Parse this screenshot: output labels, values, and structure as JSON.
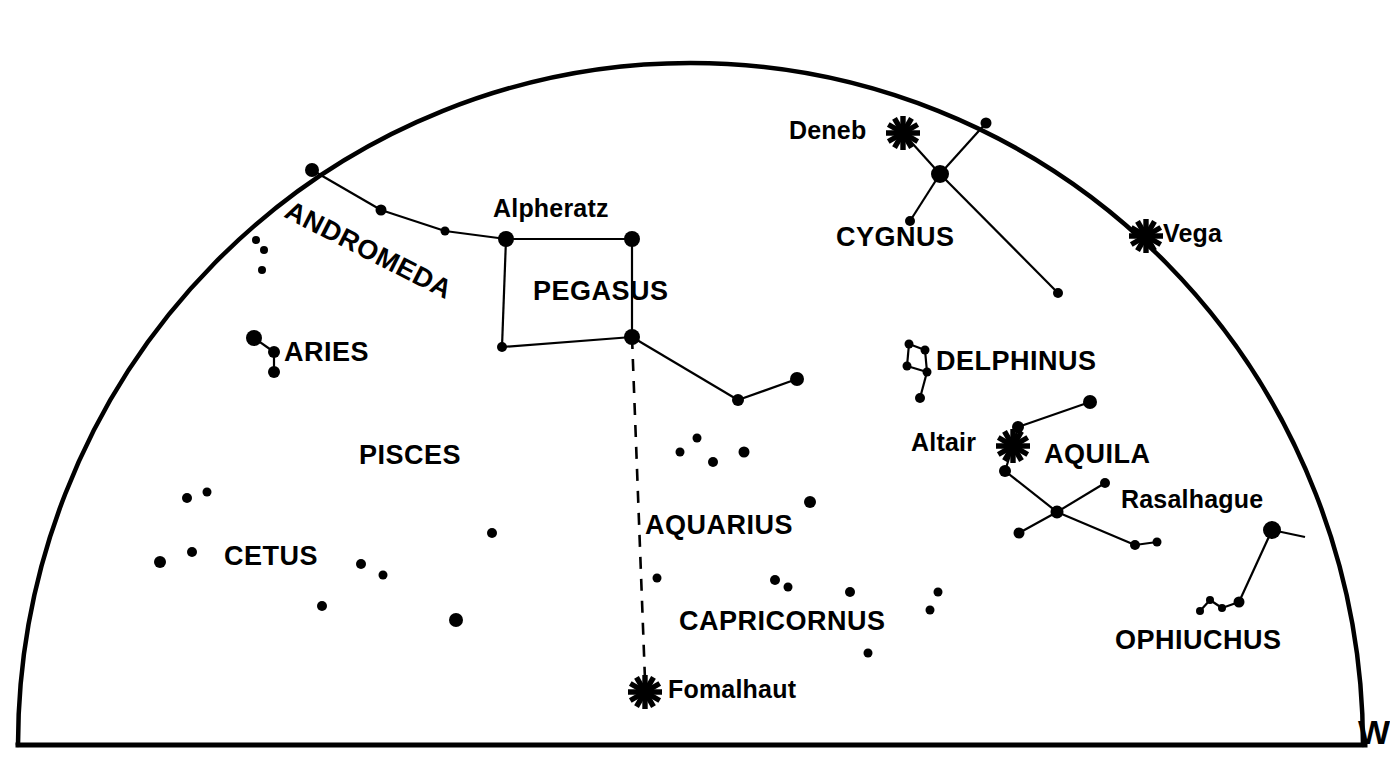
{
  "chart_data": {
    "type": "scatter",
    "xlabel": "",
    "ylabel": "",
    "xlim": [
      0,
      1381
    ],
    "ylim": [
      0,
      773
    ],
    "grid": false,
    "legend": false,
    "dome": {
      "left_x": 18,
      "right_x": 1363,
      "baseline_y": 745,
      "apex_y": 63,
      "apex_x": 690
    },
    "bright_star_markers": [
      {
        "name": "Deneb",
        "x": 903,
        "y": 133,
        "marker": "asterisk"
      },
      {
        "name": "Vega",
        "x": 1146,
        "y": 236,
        "marker": "asterisk"
      },
      {
        "name": "Altair",
        "x": 1013,
        "y": 446,
        "marker": "asterisk"
      },
      {
        "name": "Fomalhaut",
        "x": 645,
        "y": 692,
        "marker": "asterisk"
      }
    ],
    "constellations": [
      {
        "name": "ANDROMEDA",
        "label_x": 293,
        "label_y": 197,
        "rotation": 27
      },
      {
        "name": "PEGASUS",
        "label_x": 533,
        "label_y": 278
      },
      {
        "name": "ARIES",
        "label_x": 284,
        "label_y": 339
      },
      {
        "name": "PISCES",
        "label_x": 359,
        "label_y": 442
      },
      {
        "name": "CETUS",
        "label_x": 224,
        "label_y": 543
      },
      {
        "name": "AQUARIUS",
        "label_x": 645,
        "label_y": 512
      },
      {
        "name": "CAPRICORNUS",
        "label_x": 679,
        "label_y": 608
      },
      {
        "name": "CYGNUS",
        "label_x": 836,
        "label_y": 224
      },
      {
        "name": "DELPHINUS",
        "label_x": 936,
        "label_y": 348
      },
      {
        "name": "AQUILA",
        "label_x": 1044,
        "label_y": 441
      },
      {
        "name": "OPHIUCHUS",
        "label_x": 1115,
        "label_y": 627
      }
    ],
    "named_stars": [
      {
        "name": "Alpheratz",
        "label_x": 493,
        "label_y": 196
      },
      {
        "name": "Deneb",
        "label_x": 789,
        "label_y": 118
      },
      {
        "name": "Vega",
        "label_x": 1163,
        "label_y": 221
      },
      {
        "name": "Altair",
        "label_x": 911,
        "label_y": 430
      },
      {
        "name": "Rasalhague",
        "label_x": 1121,
        "label_y": 487
      },
      {
        "name": "Fomalhaut",
        "label_x": 668,
        "label_y": 677
      }
    ],
    "compass": [
      {
        "label": "W",
        "x": 1358,
        "y": 715
      }
    ],
    "stars": [
      {
        "x": 312,
        "y": 170,
        "r": 7
      },
      {
        "x": 381,
        "y": 210,
        "r": 5.5
      },
      {
        "x": 445,
        "y": 231,
        "r": 4.5
      },
      {
        "x": 506,
        "y": 239,
        "r": 8
      },
      {
        "x": 632,
        "y": 239,
        "r": 8
      },
      {
        "x": 502,
        "y": 347,
        "r": 5
      },
      {
        "x": 632,
        "y": 337,
        "r": 8
      },
      {
        "x": 738,
        "y": 400,
        "r": 6
      },
      {
        "x": 797,
        "y": 379,
        "r": 7
      },
      {
        "x": 254,
        "y": 338,
        "r": 8
      },
      {
        "x": 274,
        "y": 352,
        "r": 6
      },
      {
        "x": 274,
        "y": 372,
        "r": 6
      },
      {
        "x": 256,
        "y": 240,
        "r": 4
      },
      {
        "x": 264,
        "y": 250,
        "r": 4
      },
      {
        "x": 262,
        "y": 270,
        "r": 4
      },
      {
        "x": 187,
        "y": 498,
        "r": 5
      },
      {
        "x": 207,
        "y": 492,
        "r": 4.5
      },
      {
        "x": 160,
        "y": 562,
        "r": 6
      },
      {
        "x": 192,
        "y": 552,
        "r": 5
      },
      {
        "x": 361,
        "y": 564,
        "r": 5
      },
      {
        "x": 383,
        "y": 575,
        "r": 4.5
      },
      {
        "x": 492,
        "y": 533,
        "r": 5
      },
      {
        "x": 322,
        "y": 606,
        "r": 5
      },
      {
        "x": 456,
        "y": 620,
        "r": 7
      },
      {
        "x": 680,
        "y": 452,
        "r": 4.5
      },
      {
        "x": 697,
        "y": 438,
        "r": 4.5
      },
      {
        "x": 713,
        "y": 462,
        "r": 5
      },
      {
        "x": 744,
        "y": 452,
        "r": 5.5
      },
      {
        "x": 810,
        "y": 502,
        "r": 6
      },
      {
        "x": 657,
        "y": 578,
        "r": 4.5
      },
      {
        "x": 775,
        "y": 580,
        "r": 5
      },
      {
        "x": 788,
        "y": 587,
        "r": 4.5
      },
      {
        "x": 850,
        "y": 592,
        "r": 5
      },
      {
        "x": 938,
        "y": 592,
        "r": 4.5
      },
      {
        "x": 930,
        "y": 610,
        "r": 4.5
      },
      {
        "x": 868,
        "y": 653,
        "r": 4.5
      },
      {
        "x": 940,
        "y": 174,
        "r": 9
      },
      {
        "x": 986,
        "y": 123,
        "r": 5.5
      },
      {
        "x": 910,
        "y": 221,
        "r": 5
      },
      {
        "x": 1058,
        "y": 293,
        "r": 5
      },
      {
        "x": 909,
        "y": 344,
        "r": 4.5
      },
      {
        "x": 925,
        "y": 350,
        "r": 4.5
      },
      {
        "x": 927,
        "y": 372,
        "r": 4.5
      },
      {
        "x": 907,
        "y": 366,
        "r": 4.5
      },
      {
        "x": 920,
        "y": 398,
        "r": 5
      },
      {
        "x": 1018,
        "y": 427,
        "r": 6
      },
      {
        "x": 1090,
        "y": 402,
        "r": 7
      },
      {
        "x": 1005,
        "y": 471,
        "r": 6
      },
      {
        "x": 1057,
        "y": 512,
        "r": 6.5
      },
      {
        "x": 1019,
        "y": 533,
        "r": 5.5
      },
      {
        "x": 1105,
        "y": 483,
        "r": 5
      },
      {
        "x": 1135,
        "y": 545,
        "r": 5
      },
      {
        "x": 1157,
        "y": 542,
        "r": 4.5
      },
      {
        "x": 1272,
        "y": 530,
        "r": 9
      },
      {
        "x": 1239,
        "y": 602,
        "r": 5.5
      },
      {
        "x": 1222,
        "y": 608,
        "r": 4
      },
      {
        "x": 1210,
        "y": 600,
        "r": 4
      },
      {
        "x": 1200,
        "y": 611,
        "r": 4
      }
    ],
    "lines": [
      {
        "from": [
          312,
          170
        ],
        "to": [
          381,
          210
        ]
      },
      {
        "from": [
          381,
          210
        ],
        "to": [
          445,
          231
        ]
      },
      {
        "from": [
          445,
          231
        ],
        "to": [
          506,
          239
        ]
      },
      {
        "from": [
          506,
          239
        ],
        "to": [
          632,
          239
        ]
      },
      {
        "from": [
          506,
          239
        ],
        "to": [
          502,
          347
        ]
      },
      {
        "from": [
          502,
          347
        ],
        "to": [
          632,
          337
        ]
      },
      {
        "from": [
          632,
          239
        ],
        "to": [
          632,
          337
        ]
      },
      {
        "from": [
          632,
          337
        ],
        "to": [
          738,
          400
        ]
      },
      {
        "from": [
          738,
          400
        ],
        "to": [
          797,
          379
        ]
      },
      {
        "from": [
          254,
          338
        ],
        "to": [
          274,
          352
        ]
      },
      {
        "from": [
          274,
          352
        ],
        "to": [
          274,
          372
        ]
      },
      {
        "from": [
          903,
          133
        ],
        "to": [
          940,
          174
        ]
      },
      {
        "from": [
          940,
          174
        ],
        "to": [
          986,
          123
        ]
      },
      {
        "from": [
          940,
          174
        ],
        "to": [
          910,
          221
        ]
      },
      {
        "from": [
          940,
          174
        ],
        "to": [
          1058,
          293
        ]
      },
      {
        "from": [
          909,
          344
        ],
        "to": [
          925,
          350
        ]
      },
      {
        "from": [
          925,
          350
        ],
        "to": [
          927,
          372
        ]
      },
      {
        "from": [
          927,
          372
        ],
        "to": [
          907,
          366
        ]
      },
      {
        "from": [
          907,
          366
        ],
        "to": [
          909,
          344
        ]
      },
      {
        "from": [
          927,
          372
        ],
        "to": [
          920,
          398
        ]
      },
      {
        "from": [
          1018,
          427
        ],
        "to": [
          1090,
          402
        ]
      },
      {
        "from": [
          1018,
          427
        ],
        "to": [
          1013,
          446
        ]
      },
      {
        "from": [
          1013,
          446
        ],
        "to": [
          1005,
          471
        ]
      },
      {
        "from": [
          1005,
          471
        ],
        "to": [
          1057,
          512
        ]
      },
      {
        "from": [
          1057,
          512
        ],
        "to": [
          1019,
          533
        ]
      },
      {
        "from": [
          1057,
          512
        ],
        "to": [
          1105,
          483
        ]
      },
      {
        "from": [
          1057,
          512
        ],
        "to": [
          1135,
          545
        ]
      },
      {
        "from": [
          1135,
          545
        ],
        "to": [
          1157,
          542
        ]
      },
      {
        "from": [
          1272,
          530
        ],
        "to": [
          1239,
          602
        ]
      },
      {
        "from": [
          1239,
          602
        ],
        "to": [
          1222,
          608
        ]
      },
      {
        "from": [
          1222,
          608
        ],
        "to": [
          1210,
          600
        ]
      },
      {
        "from": [
          1210,
          600
        ],
        "to": [
          1200,
          611
        ]
      },
      {
        "from": [
          1272,
          530
        ],
        "to": [
          1305,
          537
        ]
      }
    ],
    "dashed_lines": [
      {
        "from": [
          632,
          337
        ],
        "to": [
          645,
          680
        ],
        "style": "dashed"
      }
    ]
  },
  "colors": {
    "ink": "#000000",
    "background": "#ffffff"
  }
}
